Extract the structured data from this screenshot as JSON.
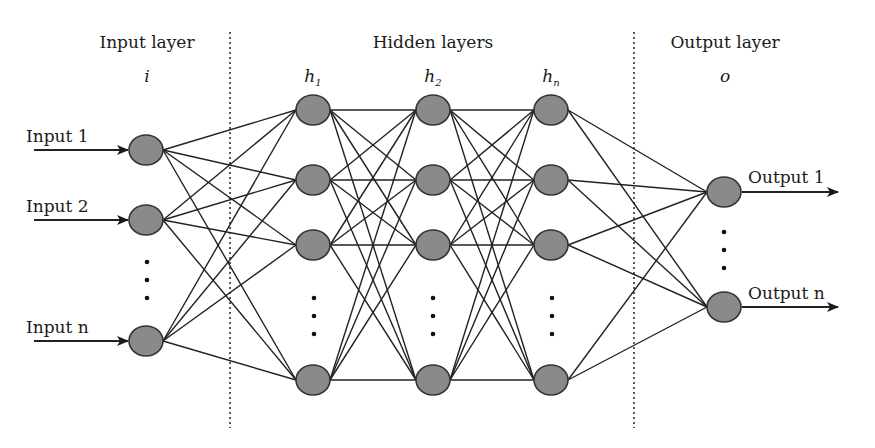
{
  "diagram": {
    "type": "neural-network",
    "sections": [
      {
        "title": "Input layer",
        "symbol": "i"
      },
      {
        "title": "Hidden layers",
        "symbols": [
          {
            "base": "h",
            "sub": "1"
          },
          {
            "base": "h",
            "sub": "2"
          },
          {
            "base": "h",
            "sub": "n"
          }
        ]
      },
      {
        "title": "Output layer",
        "symbol": "o"
      }
    ],
    "inputs": [
      "Input 1",
      "Input 2",
      "Input n"
    ],
    "outputs": [
      "Output 1",
      "Output n"
    ],
    "colors": {
      "node_fill": "#8a8a8a",
      "node_stroke": "#333333",
      "edge": "#222222",
      "divider": "#333333"
    },
    "layout": {
      "input_nodes": [
        [
          146,
          150
        ],
        [
          146,
          220
        ],
        [
          146,
          341
        ]
      ],
      "hidden_x": [
        313,
        433,
        551
      ],
      "hidden_y": [
        110,
        180,
        245,
        380
      ],
      "output_nodes": [
        [
          724,
          192
        ],
        [
          724,
          307
        ]
      ],
      "dividers_x": [
        230,
        634
      ]
    }
  }
}
